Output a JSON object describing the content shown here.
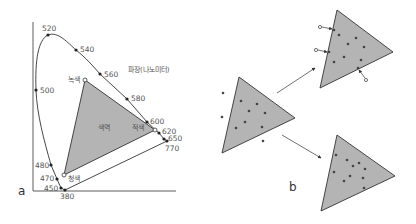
{
  "colors": {
    "triangle_fill": "#b4b4b4",
    "stroke": "#333333",
    "dot": "#444444",
    "text": "#555555"
  },
  "panel_a": {
    "label": "a",
    "axis_label": "파장(나노미터)",
    "gamut_label": "색역",
    "vertices": {
      "green": "녹색",
      "red": "적색",
      "blue": "청색"
    },
    "wavelengths": [
      {
        "nm": "520",
        "x": 48,
        "y": 35
      },
      {
        "nm": "540",
        "x": 76,
        "y": 50
      },
      {
        "nm": "560",
        "x": 100,
        "y": 74
      },
      {
        "nm": "580",
        "x": 127,
        "y": 99
      },
      {
        "nm": "600",
        "x": 147,
        "y": 122
      },
      {
        "nm": "620",
        "x": 159,
        "y": 133
      },
      {
        "nm": "650",
        "x": 164,
        "y": 139
      },
      {
        "nm": "770",
        "x": 167,
        "y": 141
      },
      {
        "nm": "500",
        "x": 36,
        "y": 90
      },
      {
        "nm": "480",
        "x": 51,
        "y": 165
      },
      {
        "nm": "470",
        "x": 57,
        "y": 179
      },
      {
        "nm": "450",
        "x": 61,
        "y": 188
      },
      {
        "nm": "380",
        "x": 65,
        "y": 190
      }
    ]
  },
  "panel_b": {
    "label": "b"
  }
}
